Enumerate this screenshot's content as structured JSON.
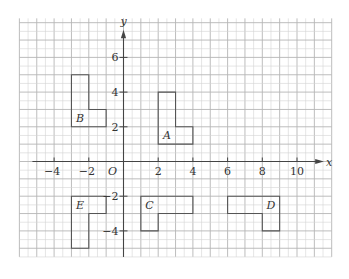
{
  "diagram": {
    "type": "coordinate-grid",
    "axes": {
      "x_label": "x",
      "y_label": "y",
      "origin_label": "O",
      "x_ticks": [
        -4,
        -2,
        2,
        4,
        6,
        8,
        10
      ],
      "y_ticks": [
        6,
        4,
        2,
        -2,
        -4
      ],
      "x_tick_labels": [
        "−4",
        "−2",
        "2",
        "4",
        "6",
        "8",
        "10"
      ],
      "y_tick_labels": [
        "6",
        "4",
        "2",
        "−2",
        "−4"
      ]
    },
    "grid": {
      "minor_step": 0.5,
      "major_step": 1,
      "x_range": [
        -6,
        12
      ],
      "y_range": [
        -5.5,
        8.25
      ]
    },
    "colors": {
      "grid_minor": "#d4d4d4",
      "grid_major": "#b5b5b5",
      "axis": "#444444",
      "shape": "#555555",
      "text": "#333333"
    },
    "shapes": [
      {
        "label": "A",
        "vertices": [
          [
            2,
            4
          ],
          [
            3,
            4
          ],
          [
            3,
            2
          ],
          [
            4,
            2
          ],
          [
            4,
            1
          ],
          [
            2,
            1
          ]
        ],
        "label_pos": [
          2.5,
          1.5
        ]
      },
      {
        "label": "B",
        "vertices": [
          [
            -3,
            5
          ],
          [
            -2,
            5
          ],
          [
            -2,
            3
          ],
          [
            -1,
            3
          ],
          [
            -1,
            2
          ],
          [
            -3,
            2
          ]
        ],
        "label_pos": [
          -2.5,
          2.5
        ]
      },
      {
        "label": "C",
        "vertices": [
          [
            1,
            -2
          ],
          [
            4,
            -2
          ],
          [
            4,
            -3
          ],
          [
            2,
            -3
          ],
          [
            2,
            -4
          ],
          [
            1,
            -4
          ]
        ],
        "label_pos": [
          1.5,
          -2.5
        ]
      },
      {
        "label": "D",
        "vertices": [
          [
            6,
            -2
          ],
          [
            9,
            -2
          ],
          [
            9,
            -4
          ],
          [
            8,
            -4
          ],
          [
            8,
            -3
          ],
          [
            6,
            -3
          ]
        ],
        "label_pos": [
          8.5,
          -2.5
        ]
      },
      {
        "label": "E",
        "vertices": [
          [
            -3,
            -2
          ],
          [
            -1,
            -2
          ],
          [
            -1,
            -3
          ],
          [
            -2,
            -3
          ],
          [
            -2,
            -5
          ],
          [
            -3,
            -5
          ]
        ],
        "label_pos": [
          -2.5,
          -2.5
        ]
      }
    ]
  }
}
